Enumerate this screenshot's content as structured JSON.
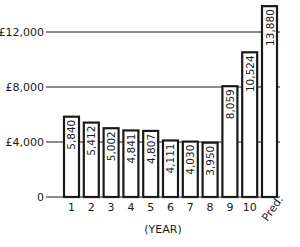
{
  "chart_data": {
    "type": "bar",
    "title": "",
    "xlabel": "(YEAR)",
    "ylabel": "",
    "categories": [
      "1",
      "2",
      "3",
      "4",
      "5",
      "6",
      "7",
      "8",
      "9",
      "10",
      "Pred."
    ],
    "values": [
      5840,
      5412,
      5002,
      4841,
      4807,
      4111,
      4030,
      3950,
      8059,
      10524,
      13880
    ],
    "value_labels": [
      "5,840",
      "5,412",
      "5,002",
      "4,841",
      "4,807",
      "4,111",
      "4,030",
      "3,950",
      "8,059",
      "10,524",
      "13,880"
    ],
    "yticks": [
      0,
      4000,
      8000,
      12000
    ],
    "ytick_labels": [
      "0",
      "£4,000",
      "£8,000",
      "£12,000"
    ],
    "ylim": [
      0,
      14200
    ],
    "grid": true,
    "legend": null,
    "colors": {
      "bar_fill": "#ffffff",
      "bar_stroke": "#1a1a1a",
      "grid": "#1a1a1a"
    }
  }
}
